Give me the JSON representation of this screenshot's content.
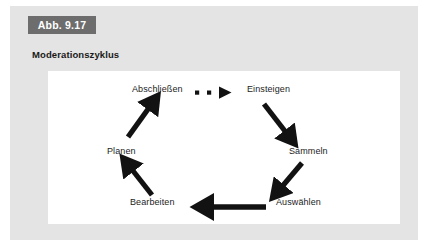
{
  "figure": {
    "number_label": "Abb. 9.17",
    "caption": "Moderationszyklus",
    "tab_color": "#6d6d6d",
    "panel_color": "#e4e4e4",
    "canvas_color": "#ffffff",
    "ink_color": "#1c1c1c"
  },
  "diagram": {
    "type": "cycle",
    "direction": "clockwise",
    "nodes": [
      {
        "id": "einsteigen",
        "label": "Einsteigen",
        "x": 210,
        "y": 19
      },
      {
        "id": "sammeln",
        "label": "Sammeln",
        "x": 258,
        "y": 80
      },
      {
        "id": "auswaehlen",
        "label": "Auswählen",
        "x": 238,
        "y": 131
      },
      {
        "id": "bearbeiten",
        "label": "Bearbeiten",
        "x": 88,
        "y": 131
      },
      {
        "id": "planen",
        "label": "Planen",
        "x": 70,
        "y": 80
      },
      {
        "id": "abschliessen",
        "label": "Abschließen",
        "x": 84,
        "y": 19
      }
    ],
    "arrows": [
      {
        "id": "einsteigen-to-sammeln",
        "from": "einsteigen",
        "to": "sammeln",
        "style": "solid"
      },
      {
        "id": "sammeln-to-auswaehlen",
        "from": "sammeln",
        "to": "auswaehlen",
        "style": "solid"
      },
      {
        "id": "auswaehlen-to-bearbeiten",
        "from": "auswaehlen",
        "to": "bearbeiten",
        "style": "solid"
      },
      {
        "id": "bearbeiten-to-planen",
        "from": "bearbeiten",
        "to": "planen",
        "style": "solid"
      },
      {
        "id": "planen-to-abschliessen",
        "from": "planen",
        "to": "abschliessen",
        "style": "solid"
      },
      {
        "id": "abschliessen-to-einsteigen",
        "from": "abschliessen",
        "to": "einsteigen",
        "style": "dotted"
      }
    ]
  }
}
